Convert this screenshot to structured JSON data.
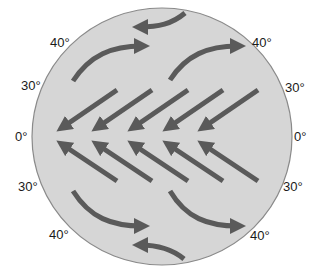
{
  "diagram": {
    "colors": {
      "globe_fill": "#d6d6d6",
      "globe_outline": "#8a8a8a",
      "arrow": "#5a5a5a",
      "label_text": "#1a1a1a",
      "background": "#ffffff"
    },
    "latitude_labels": {
      "left": [
        {
          "text": "40°",
          "position": "upper-left"
        },
        {
          "text": "30°",
          "position": "mid-upper-left"
        },
        {
          "text": "0°",
          "position": "left-equator"
        },
        {
          "text": "30°",
          "position": "mid-lower-left"
        },
        {
          "text": "40°",
          "position": "lower-left"
        }
      ],
      "right": [
        {
          "text": "40°",
          "position": "upper-right"
        },
        {
          "text": "30°",
          "position": "mid-upper-right"
        },
        {
          "text": "0°",
          "position": "right-equator"
        },
        {
          "text": "30°",
          "position": "mid-lower-right"
        },
        {
          "text": "40°",
          "position": "lower-right"
        }
      ]
    },
    "wind_groups": [
      {
        "name": "polar-easterly-north",
        "count": 1,
        "direction": "west"
      },
      {
        "name": "westerlies-north",
        "count": 2,
        "direction": "east (curving northeast)"
      },
      {
        "name": "northeast-trades",
        "count": 5,
        "direction": "southwest toward equator"
      },
      {
        "name": "southeast-trades",
        "count": 5,
        "direction": "northwest toward equator"
      },
      {
        "name": "westerlies-south",
        "count": 2,
        "direction": "east (curving southeast)"
      },
      {
        "name": "polar-easterly-south",
        "count": 1,
        "direction": "west"
      }
    ]
  }
}
